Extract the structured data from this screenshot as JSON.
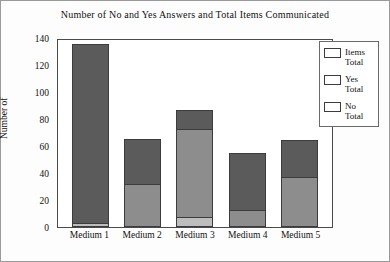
{
  "chart_data": {
    "type": "bar",
    "stacked": true,
    "title": "Number of No and Yes Answers and Total Items Communicated",
    "xlabel": "",
    "ylabel": "Number of",
    "categories": [
      "Medium 1",
      "Medium 2",
      "Medium 3",
      "Medium 4",
      "Medium 5"
    ],
    "series": [
      {
        "name": "No Total",
        "values": [
          2,
          0,
          7,
          0,
          0
        ],
        "color": "#bdbdbd"
      },
      {
        "name": "Yes Total",
        "values": [
          0,
          31,
          65,
          12,
          36
        ],
        "color": "#8d8d8d"
      },
      {
        "name": "Items Total",
        "values": [
          134,
          64,
          85,
          53,
          63
        ],
        "color": "#5b5b5b"
      }
    ],
    "ylim": [
      0,
      140
    ],
    "yticks": [
      140,
      120,
      100,
      80,
      60,
      40,
      20,
      0
    ],
    "grid": false,
    "legend_position": "top-right"
  },
  "legend": {
    "entries": [
      {
        "line1": "Items",
        "line2": "Total",
        "swatch": "#5b5b5b"
      },
      {
        "line1": "Yes",
        "line2": "Total",
        "swatch": "#8d8d8d"
      },
      {
        "line1": "No",
        "line2": "Total",
        "swatch": "#bdbdbd"
      }
    ]
  }
}
